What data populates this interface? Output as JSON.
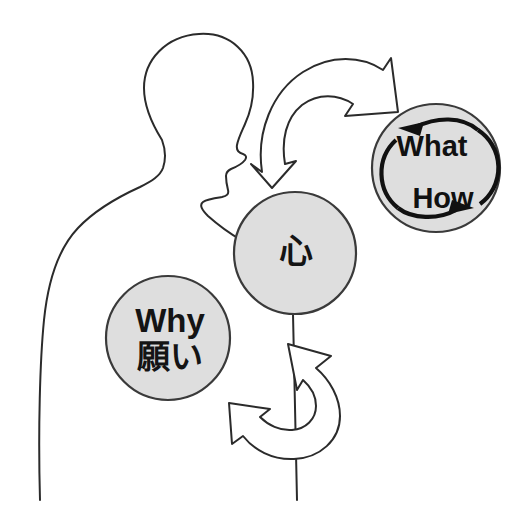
{
  "figure": {
    "background_color": "#ffffff"
  },
  "colors": {
    "bubble_fill": "#dedede",
    "bubble_stroke": "#3a3a3a",
    "outline_stroke": "#2b2b2b",
    "text": "#111111",
    "arrow_fill": "#ffffff"
  },
  "nodes": {
    "heart": {
      "label": "心",
      "cx": 295,
      "cy": 253,
      "r": 61
    },
    "why": {
      "label_en": "Why",
      "label_jp": "願い",
      "cx": 168,
      "cy": 338,
      "r": 62
    },
    "what_how": {
      "label_top": "What",
      "label_bottom": "How",
      "cx": 436,
      "cy": 168,
      "r": 64
    }
  },
  "arrows": {
    "top": {
      "name": "curved-arrow-up-right",
      "direction": "clockwise-up-right"
    },
    "bottom": {
      "name": "curved-arrow-up-left",
      "direction": "counterclockwise-up"
    }
  },
  "cycle": {
    "name": "cycle-arrows",
    "top_arrow_direction": "left",
    "bottom_arrow_direction": "right"
  },
  "silhouette": {
    "name": "human-profile-bust",
    "facing": "right"
  }
}
